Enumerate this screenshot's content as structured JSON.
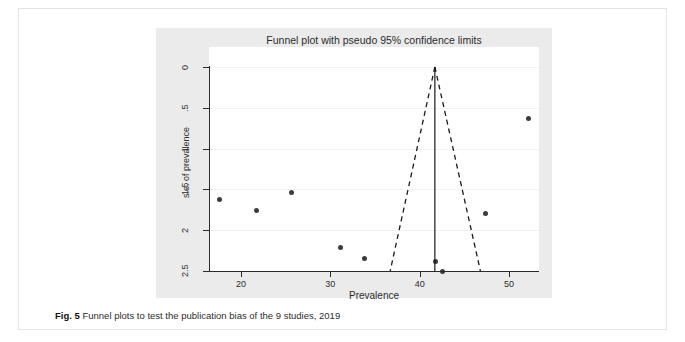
{
  "figure": {
    "caption_prefix": "Fig. 5",
    "caption_text": "Funnel plots to test the publication bias of the 9 studies, 2019"
  },
  "chart_data": {
    "type": "scatter",
    "title": "Funnel plot with pseudo 95% confidence limits",
    "xlabel": "Prevalence",
    "ylabel": "s.e. of prevalence",
    "xlim": [
      16,
      53.5
    ],
    "ylim": [
      0,
      2.55
    ],
    "y_axis_inverted": true,
    "grid": true,
    "legend": "none",
    "xticks": [
      20,
      30,
      40,
      50
    ],
    "xtick_labels": [
      "20",
      "30",
      "40",
      "50"
    ],
    "yticks": [
      0,
      0.5,
      1,
      1.5,
      2,
      2.5
    ],
    "ytick_labels": [
      "0",
      ".5",
      "1",
      "1.5",
      "2",
      "2.5"
    ],
    "series": [
      {
        "name": "studies",
        "marker": "filled-circle",
        "color": "#3c3c3c",
        "x": [
          17.6,
          21.7,
          25.7,
          31.1,
          33.8,
          41.8,
          42.6,
          47.4,
          52.2
        ],
        "y": [
          1.62,
          1.76,
          1.54,
          2.21,
          2.35,
          2.38,
          2.5,
          1.8,
          0.63
        ]
      }
    ],
    "annotations": {
      "reference_line": {
        "type": "vertical-solid",
        "x": 41.7,
        "y_from": 0.0,
        "y_to": 2.5,
        "color": "#1a1a1a"
      },
      "pseudo_95_limits": {
        "type": "dashed-funnel",
        "apex_x": 41.7,
        "apex_y": 0.0,
        "lower_left_x": 36.7,
        "lower_right_x": 46.8,
        "base_y": 2.5,
        "color": "#1a1a1a"
      }
    },
    "colors": {
      "panel_background": "#ebebeb",
      "plot_background": "#ffffff",
      "gridline": "#f2f2f2",
      "axis": "#2b2b2b",
      "marker": "#3c3c3c"
    }
  }
}
